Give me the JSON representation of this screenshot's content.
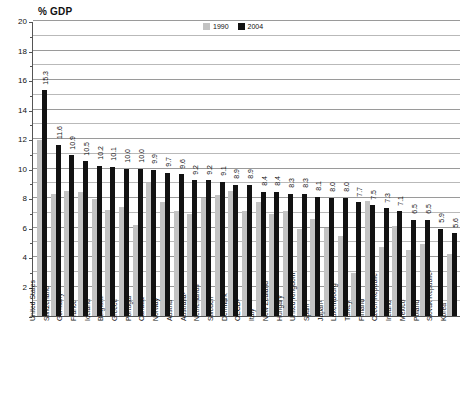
{
  "chart": {
    "title": "% GDP",
    "legend": [
      {
        "label": "1990",
        "color": "#c3c3c3"
      },
      {
        "label": "2004",
        "color": "#121212"
      }
    ]
  },
  "chart_data": {
    "type": "bar",
    "title": "% GDP",
    "xlabel": "",
    "ylabel": "% GDP",
    "ylim": [
      0,
      20
    ],
    "yticks": [
      0,
      2,
      4,
      6,
      8,
      10,
      12,
      14,
      16,
      18,
      20
    ],
    "ytick_labels": [
      "",
      "2",
      "4",
      "6",
      "8",
      "10",
      "12",
      "14",
      "16",
      "18",
      "20"
    ],
    "minor_gridlines": [
      1,
      3,
      5,
      7,
      9,
      11,
      13,
      15,
      17,
      19
    ],
    "grid": true,
    "legend_position": "top-right",
    "categories": [
      "United States",
      "Switzerland",
      "Germany¹",
      "France",
      "Iceland",
      "Belgium¹",
      "Greece",
      "Portugal",
      "Canada",
      "Norway",
      "Austria",
      "Australia¹",
      "Netherlands",
      "Sweden",
      "Denmark",
      "OECD²",
      "Italy",
      "New Zealand",
      "Hungary",
      "United Kingdom",
      "Spain",
      "Japan¹",
      "Luxembourg",
      "Turkey",
      "Finland",
      "Czech Republic",
      "Ireland",
      "Mexico",
      "Poland",
      "Slovak Republic¹",
      "Korea"
    ],
    "series": [
      {
        "name": "1990",
        "color": "#c3c3c3",
        "values": [
          11.9,
          8.3,
          8.5,
          8.4,
          7.9,
          7.2,
          7.4,
          6.2,
          9.0,
          7.7,
          7.1,
          6.9,
          8.0,
          8.2,
          8.5,
          7.1,
          7.7,
          6.9,
          7.1,
          5.9,
          6.6,
          6.0,
          5.4,
          2.9,
          7.8,
          4.7,
          6.1,
          4.5,
          4.9,
          0.0,
          4.2
        ]
      },
      {
        "name": "2004",
        "color": "#121212",
        "values": [
          15.3,
          11.6,
          10.9,
          10.5,
          10.2,
          10.1,
          10.0,
          10.0,
          9.9,
          9.7,
          9.6,
          9.2,
          9.2,
          9.1,
          8.9,
          8.9,
          8.4,
          8.4,
          8.3,
          8.3,
          8.1,
          8.0,
          8.0,
          7.7,
          7.5,
          7.3,
          7.1,
          6.5,
          6.5,
          5.9,
          5.6
        ]
      }
    ],
    "data_labels": [
      "15.3",
      "11.6",
      "10.9",
      "10.5",
      "10.2",
      "10.1",
      "10.0",
      "10.0",
      "9.9",
      "9.7",
      "9.6",
      "9.2",
      "9.2",
      "9.1",
      "8.9",
      "8.9",
      "8.4",
      "8.4",
      "8.3",
      "8.3",
      "8.1",
      "8.0",
      "8.0",
      "7.7",
      "7.5",
      "7.3",
      "7.1",
      "6.5",
      "6.5",
      "5.9",
      "5.6"
    ]
  }
}
